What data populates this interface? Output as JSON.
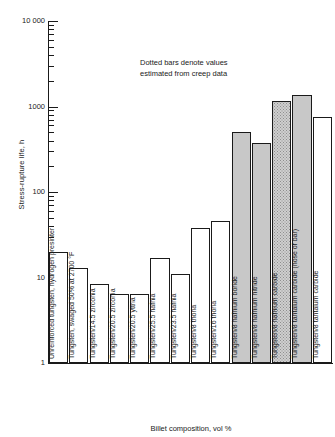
{
  "chart_data": {
    "type": "bar",
    "title": "",
    "xlabel": "Billet composition, vol %",
    "ylabel": "Stress-rupture life, h",
    "yscale": "log",
    "ylim": [
      1,
      10000
    ],
    "ytick_labels": [
      "10 000",
      "1000",
      "100",
      "10",
      "1"
    ],
    "ytick_values": [
      10000,
      1000,
      100,
      10,
      1
    ],
    "grid": false,
    "legend": null,
    "annotations": [
      "Dotted bars denote values",
      "estimated from creep data"
    ],
    "categories": [
      "Unreinforced tungsten, hydrogen presinter",
      "Tungsten, swaged 50% at 2700 °F",
      "Tungsten/14.5 zirconia",
      "Tungsten/20.5 zirconia",
      "Tungsten/20.5 yttria",
      "Tungsten/25.5 hafnia",
      "Tungsten/23.5 hafnia",
      "Tungsten/8 thoria",
      "Tungsten/16 thoria",
      "Tungsten/8 hafnium boride",
      "Tungsten/8 hafnium nitride",
      "Tungsten/8 hafnium carbide",
      "Tungsten/8 tantalum carbide (nose of bar)",
      "Tungsten/8 tantalum carbide"
    ],
    "values": [
      20,
      13,
      8.5,
      6.5,
      6.5,
      17,
      11,
      38,
      46,
      510,
      370,
      1150,
      1350,
      760
    ],
    "fills": [
      "open",
      "open",
      "open",
      "open",
      "open",
      "open",
      "open",
      "open",
      "open",
      "shaded",
      "shaded",
      "dotted",
      "shaded",
      "open"
    ],
    "fill_legend": {
      "dotted": "values estimated from creep data",
      "shaded": "measured values",
      "open": "measured values"
    }
  },
  "axis": {
    "y_label": "Stress-rupture life, h",
    "x_label": "Billet composition, vol %",
    "y_ticks": [
      "10 000",
      "1000",
      "100",
      "10",
      "1"
    ]
  },
  "bars": [
    {
      "label": "Unreinforced tungsten, hydrogen presinter",
      "value": 20,
      "fill": "open"
    },
    {
      "label": "Tungsten, swaged 50% at 2700 °F",
      "value": 13,
      "fill": "open"
    },
    {
      "label": "Tungsten/14.5 zirconia",
      "value": 8.5,
      "fill": "open"
    },
    {
      "label": "Tungsten/20.5 zirconia",
      "value": 6.5,
      "fill": "open"
    },
    {
      "label": "Tungsten/20.5 yttria",
      "value": 6.5,
      "fill": "open"
    },
    {
      "label": "Tungsten/25.5 hafnia",
      "value": 17,
      "fill": "open"
    },
    {
      "label": "Tungsten/23.5 hafnia",
      "value": 11,
      "fill": "open"
    },
    {
      "label": "Tungsten/8 thoria",
      "value": 38,
      "fill": "open"
    },
    {
      "label": "Tungsten/16 thoria",
      "value": 46,
      "fill": "open"
    },
    {
      "label": "Tungsten/8 hafnium boride",
      "value": 510,
      "fill": "shaded"
    },
    {
      "label": "Tungsten/8 hafnium nitride",
      "value": 370,
      "fill": "shaded"
    },
    {
      "label": "Tungsten/8 hafnium carbide",
      "value": 1150,
      "fill": "dotted"
    },
    {
      "label": "Tungsten/8 tantalum carbide (nose of bar)",
      "value": 1350,
      "fill": "shaded"
    },
    {
      "label": "Tungsten/8 tantalum carbide",
      "value": 760,
      "fill": "open"
    }
  ],
  "annotation": {
    "line1": "Dotted bars denote values",
    "line2": "estimated from creep data"
  },
  "colors": {
    "ink": "#1a1a1a",
    "shaded_fill": "#c8c8c8",
    "dotted_fill": "#cfcfcf",
    "background": "#ffffff"
  }
}
